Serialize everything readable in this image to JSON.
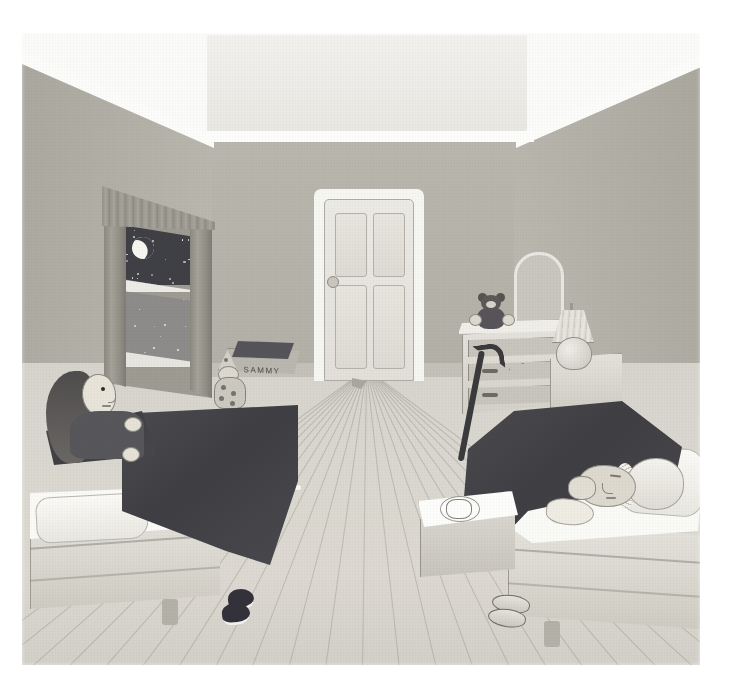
{
  "scene": {
    "title": "Bedroom at Night",
    "medium": "watercolour illustration",
    "caption": "",
    "frame": {
      "x": 22,
      "y": 33,
      "width": 678,
      "height": 632
    }
  },
  "palette": {
    "wall": "#b4b2a9",
    "wall_back": "#b8b6ad",
    "ceiling": "#f2f1ee",
    "floor": "#d9d7cf",
    "blanket_dark": "#44434a",
    "linen_white": "#fafaf7",
    "night_sky": "#3f3f46",
    "moon": "#f6f5f0",
    "wood_trim": "#9d9b92",
    "cane_black": "#3a3a3c"
  },
  "room": {
    "ceiling_label": "ceiling",
    "back_wall_label": "back wall",
    "left_wall_label": "left wall",
    "right_wall_label": "right wall",
    "floor_label": "wooden plank floor"
  },
  "window": {
    "label": "bedroom window",
    "curtain_label": "curtains",
    "valance_label": "pleated valance",
    "sky_label": "night sky",
    "moon_label": "crescent moon",
    "star_count": 34,
    "sill_label": "window sill"
  },
  "door": {
    "label": "panel door",
    "panels": 4,
    "knob_label": "doorknob",
    "state": "closed"
  },
  "toybox": {
    "label": "toy box",
    "name_text": "SAMMY",
    "lid_label": "open lid"
  },
  "toys": {
    "clown_label": "clown doll",
    "clown_hat_label": "cone hat",
    "teddy_label": "teddy bear"
  },
  "furniture": {
    "dresser_label": "chest of drawers",
    "dresser_drawers": 3,
    "mirror_label": "standing mirror",
    "nightstand_label": "night stand",
    "lamp_label": "table lamp",
    "cane_label": "walking cane",
    "tray_table_label": "bed tray table",
    "cup_label": "teacup and saucer",
    "cloth_label": "white cloth"
  },
  "beds": [
    {
      "id": "left-bed",
      "label": "girl's bed",
      "blanket": "dark blanket",
      "pillow": "white pillow",
      "occupant": "girl"
    },
    {
      "id": "right-bed",
      "label": "grandmother's bed",
      "blanket": "dark blanket",
      "pillow": "white pillow",
      "occupant": "grandmother"
    }
  ],
  "figures": {
    "girl": {
      "label": "girl sitting up awake",
      "hair": "long dark hair",
      "state": "awake, looking toward window"
    },
    "grandmother": {
      "label": "grandmother asleep",
      "cap": "frilled nightcap",
      "state": "asleep on pillow"
    }
  },
  "slippers": {
    "left_label": "dark slippers",
    "right_label": "light slippers"
  }
}
